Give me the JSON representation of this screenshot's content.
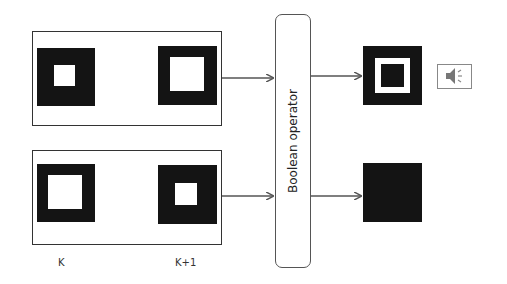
{
  "diagram": {
    "operator": {
      "label": "Boolean operator"
    },
    "frame_labels": {
      "k": "K",
      "k_plus_1": "K+1"
    },
    "inputs": [
      {
        "name": "top-pair",
        "frames": [
          {
            "frame": "K",
            "pattern": "black square with small white center"
          },
          {
            "frame": "K+1",
            "pattern": "black square with large white center"
          }
        ]
      },
      {
        "name": "bottom-pair",
        "frames": [
          {
            "frame": "K",
            "pattern": "black square with large white center"
          },
          {
            "frame": "K+1",
            "pattern": "black square with small white center"
          }
        ]
      }
    ],
    "outputs": [
      {
        "name": "top-output",
        "pattern": "black square with white ring",
        "icon": "speaker-icon"
      },
      {
        "name": "bottom-output",
        "pattern": "solid black square"
      }
    ],
    "colors": {
      "fill": "#141414",
      "background": "#ffffff",
      "stroke": "#555555"
    }
  }
}
